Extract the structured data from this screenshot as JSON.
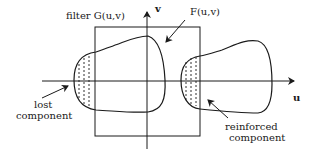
{
  "diagram": {
    "labels": {
      "filter": "filter G(u,v)",
      "spectrum": "F(u,v)",
      "v_axis": "v",
      "u_axis": "u",
      "lost_line1": "lost",
      "lost_line2": "component",
      "reinforced_line1": "reinforced",
      "reinforced_line2": "component"
    },
    "colors": {
      "stroke": "#1a1a1a",
      "background": "#ffffff"
    }
  }
}
